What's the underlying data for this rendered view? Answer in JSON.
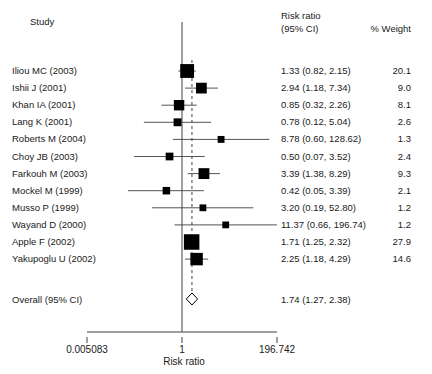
{
  "header": {
    "study_label": "Study",
    "rr_line1": "Risk ratio",
    "rr_line2": "(95% CI)",
    "weight_label": "% Weight"
  },
  "overall": {
    "label": "Overall (95% CI)",
    "rr_text": "1.74 (1.27, 2.38)",
    "est": 1.74,
    "lo": 1.27,
    "hi": 2.38
  },
  "axis": {
    "tick_low": "0.005083",
    "tick_mid": "1",
    "tick_high": "196.742",
    "title": "Risk ratio"
  },
  "colors": {
    "marker": "#000000",
    "line": "#404040",
    "text": "#1a1a1a",
    "diamond_fill": "#ffffff"
  },
  "chart_data": {
    "type": "forest",
    "title": "",
    "xlabel": "Risk ratio",
    "ylabel": "",
    "xscale": "log",
    "xlim": [
      0.005083,
      196.742
    ],
    "xticks": [
      0.005083,
      1,
      196.742
    ],
    "xticklabels": [
      "0.005083",
      "1",
      "196.742"
    ],
    "grid": false,
    "null_line": 1,
    "summary_line": 1.74,
    "legend": "",
    "columns": [
      "Study",
      "Risk ratio (95% CI)",
      "% Weight"
    ],
    "studies": [
      {
        "study": "Iliou MC (2003)",
        "rr_text": "1.33 (0.82, 2.15)",
        "est": 1.33,
        "lo": 0.82,
        "hi": 2.15,
        "weight": 20.1,
        "weight_text": "20.1"
      },
      {
        "study": "Ishii J (2001)",
        "rr_text": "2.94 (1.18, 7.34)",
        "est": 2.94,
        "lo": 1.18,
        "hi": 7.34,
        "weight": 9.0,
        "weight_text": "9.0"
      },
      {
        "study": "Khan IA (2001)",
        "rr_text": "0.85 (0.32, 2.26)",
        "est": 0.85,
        "lo": 0.32,
        "hi": 2.26,
        "weight": 8.1,
        "weight_text": "8.1"
      },
      {
        "study": "Lang K (2001)",
        "rr_text": "0.78 (0.12, 5.04)",
        "est": 0.78,
        "lo": 0.12,
        "hi": 5.04,
        "weight": 2.6,
        "weight_text": "2.6"
      },
      {
        "study": "Roberts M (2004)",
        "rr_text": "8.78 (0.60, 128.62)",
        "est": 8.78,
        "lo": 0.6,
        "hi": 128.62,
        "weight": 1.3,
        "weight_text": "1.3"
      },
      {
        "study": "Choy JB (2003)",
        "rr_text": "0.50 (0.07, 3.52)",
        "est": 0.5,
        "lo": 0.07,
        "hi": 3.52,
        "weight": 2.4,
        "weight_text": "2.4"
      },
      {
        "study": "Farkouh M (2003)",
        "rr_text": "3.39 (1.38, 8.29)",
        "est": 3.39,
        "lo": 1.38,
        "hi": 8.29,
        "weight": 9.3,
        "weight_text": "9.3"
      },
      {
        "study": "Mockel M (1999)",
        "rr_text": "0.42 (0.05, 3.39)",
        "est": 0.42,
        "lo": 0.05,
        "hi": 3.39,
        "weight": 2.1,
        "weight_text": "2.1"
      },
      {
        "study": "Musso P (1999)",
        "rr_text": "3.20 (0.19, 52.80)",
        "est": 3.2,
        "lo": 0.19,
        "hi": 52.8,
        "weight": 1.2,
        "weight_text": "1.2"
      },
      {
        "study": "Wayand D (2000)",
        "rr_text": "11.37 (0.66, 196.74)",
        "est": 11.37,
        "lo": 0.66,
        "hi": 196.74,
        "weight": 1.2,
        "weight_text": "1.2"
      },
      {
        "study": "Apple F (2002)",
        "rr_text": "1.71 (1.25, 2.32)",
        "est": 1.71,
        "lo": 1.25,
        "hi": 2.32,
        "weight": 27.9,
        "weight_text": "27.9"
      },
      {
        "study": "Yakupoglu U (2002)",
        "rr_text": "2.25 (1.18, 4.29)",
        "est": 2.25,
        "lo": 1.18,
        "hi": 4.29,
        "weight": 14.6,
        "weight_text": "14.6"
      }
    ]
  }
}
